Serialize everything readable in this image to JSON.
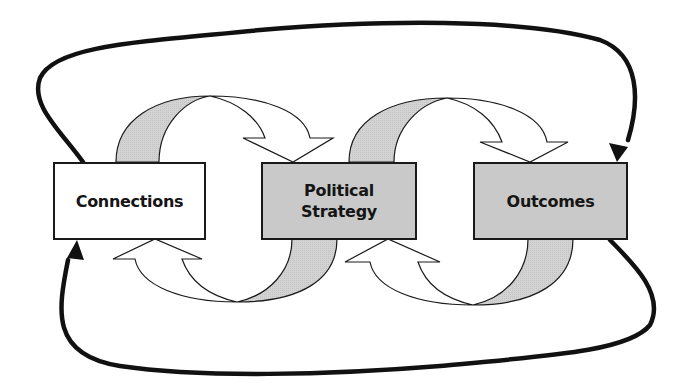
{
  "diagram": {
    "type": "cyclical flow diagram",
    "nodes": [
      {
        "id": "connections",
        "label": "Connections",
        "fill": "#ffffff"
      },
      {
        "id": "political-strategy",
        "label": "Political\nStrategy",
        "fill": "#d3d3d3"
      },
      {
        "id": "outcomes",
        "label": "Outcomes",
        "fill": "#d3d3d3"
      }
    ],
    "edges": [
      {
        "from": "connections",
        "to": "political-strategy",
        "style": "curved block arrow (over top)"
      },
      {
        "from": "political-strategy",
        "to": "connections",
        "style": "curved block arrow (under bottom)"
      },
      {
        "from": "political-strategy",
        "to": "outcomes",
        "style": "curved block arrow (over top)"
      },
      {
        "from": "outcomes",
        "to": "political-strategy",
        "style": "curved block arrow (under bottom)"
      },
      {
        "from": "connections",
        "to": "outcomes",
        "style": "thick black feedback loop (top)"
      },
      {
        "from": "outcomes",
        "to": "connections",
        "style": "thick black feedback loop (bottom)"
      }
    ],
    "colors": {
      "stroke": "#1a1a1a",
      "band_fill": "#d3d3d3",
      "arrow_fill": "#ffffff",
      "background": "#ffffff"
    }
  }
}
